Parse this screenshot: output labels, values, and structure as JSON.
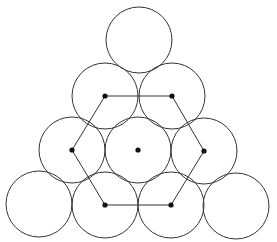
{
  "diagram": {
    "stroke_color": "#333333",
    "dot_color": "#111111",
    "circle_radius": 33,
    "circles": [
      {
        "row": 1,
        "cx": 139,
        "cy": 40
      },
      {
        "row": 2,
        "cx": 105,
        "cy": 96
      },
      {
        "row": 2,
        "cx": 172,
        "cy": 96
      },
      {
        "row": 3,
        "cx": 72,
        "cy": 150
      },
      {
        "row": 3,
        "cx": 138,
        "cy": 150
      },
      {
        "row": 3,
        "cx": 204,
        "cy": 151
      },
      {
        "row": 4,
        "cx": 39,
        "cy": 204
      },
      {
        "row": 4,
        "cx": 105,
        "cy": 205
      },
      {
        "row": 4,
        "cx": 171,
        "cy": 205
      },
      {
        "row": 4,
        "cx": 236,
        "cy": 206
      }
    ],
    "hexagon_vertices": [
      {
        "x": 105,
        "y": 96
      },
      {
        "x": 172,
        "y": 96
      },
      {
        "x": 204,
        "y": 151
      },
      {
        "x": 171,
        "y": 205
      },
      {
        "x": 105,
        "y": 205
      },
      {
        "x": 72,
        "y": 150
      }
    ],
    "center_dot": {
      "x": 138,
      "y": 150
    }
  }
}
